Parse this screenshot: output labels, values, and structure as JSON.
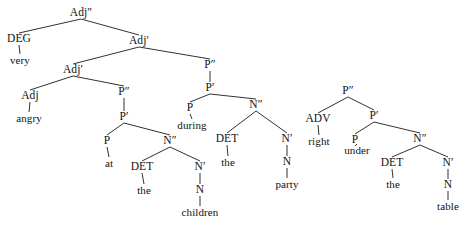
{
  "diagram": {
    "background_color": "#ffffff",
    "line_color": "#1a1a1a",
    "text_color": "#111111",
    "width": 465,
    "height": 225
  },
  "trees": [
    {
      "id": "tree-adjective-phrase",
      "root_label": "Adj″",
      "sentence": "very angry at the children during the party"
    },
    {
      "id": "tree-prepositional-phrase",
      "root_label": "P″",
      "sentence": "right under the table"
    }
  ],
  "nodes": [
    {
      "id": "n1",
      "label": "Adj″",
      "kind": "category",
      "x": 81,
      "y": 13,
      "tree": 0
    },
    {
      "id": "n2",
      "label": "DEG",
      "kind": "category",
      "x": 19,
      "y": 39,
      "tree": 0
    },
    {
      "id": "n3",
      "label": "very",
      "kind": "word",
      "x": 20,
      "y": 60,
      "tree": 0
    },
    {
      "id": "n4",
      "label": "Adj′",
      "kind": "category",
      "x": 139,
      "y": 41,
      "tree": 0
    },
    {
      "id": "n5",
      "label": "Adj′",
      "kind": "category",
      "x": 73,
      "y": 70,
      "tree": 0
    },
    {
      "id": "n6",
      "label": "Adj",
      "kind": "category",
      "x": 30,
      "y": 96,
      "tree": 0
    },
    {
      "id": "n7",
      "label": "angry",
      "kind": "word",
      "x": 29,
      "y": 118,
      "tree": 0
    },
    {
      "id": "n8",
      "label": "P″",
      "kind": "category",
      "x": 124,
      "y": 92,
      "tree": 0
    },
    {
      "id": "n9",
      "label": "P′",
      "kind": "category",
      "x": 124,
      "y": 117,
      "tree": 0
    },
    {
      "id": "n10",
      "label": "P",
      "kind": "category",
      "x": 107,
      "y": 141,
      "tree": 0
    },
    {
      "id": "n11",
      "label": "at",
      "kind": "word",
      "x": 109,
      "y": 163,
      "tree": 0
    },
    {
      "id": "n12",
      "label": "N″",
      "kind": "category",
      "x": 170,
      "y": 141,
      "tree": 0
    },
    {
      "id": "n13",
      "label": "DET",
      "kind": "category",
      "x": 142,
      "y": 167,
      "tree": 0
    },
    {
      "id": "n14",
      "label": "the",
      "kind": "word",
      "x": 144,
      "y": 190,
      "tree": 0
    },
    {
      "id": "n15",
      "label": "N′",
      "kind": "category",
      "x": 200,
      "y": 167,
      "tree": 0
    },
    {
      "id": "n16",
      "label": "N",
      "kind": "category",
      "x": 200,
      "y": 190,
      "tree": 0
    },
    {
      "id": "n17",
      "label": "children",
      "kind": "word",
      "x": 200,
      "y": 212,
      "tree": 0
    },
    {
      "id": "n18",
      "label": "P″",
      "kind": "category",
      "x": 210,
      "y": 65,
      "tree": 0
    },
    {
      "id": "n19",
      "label": "P′",
      "kind": "category",
      "x": 210,
      "y": 88,
      "tree": 0
    },
    {
      "id": "n20",
      "label": "P",
      "kind": "category",
      "x": 190,
      "y": 108,
      "tree": 0
    },
    {
      "id": "n21",
      "label": "during",
      "kind": "word",
      "x": 192,
      "y": 125,
      "tree": 0
    },
    {
      "id": "n22",
      "label": "N″",
      "kind": "category",
      "x": 256,
      "y": 105,
      "tree": 0
    },
    {
      "id": "n23",
      "label": "DET",
      "kind": "category",
      "x": 227,
      "y": 139,
      "tree": 0
    },
    {
      "id": "n24",
      "label": "the",
      "kind": "word",
      "x": 228,
      "y": 162,
      "tree": 0
    },
    {
      "id": "n25",
      "label": "N′",
      "kind": "category",
      "x": 287,
      "y": 139,
      "tree": 0
    },
    {
      "id": "n26",
      "label": "N",
      "kind": "category",
      "x": 287,
      "y": 162,
      "tree": 0
    },
    {
      "id": "n27",
      "label": "party",
      "kind": "word",
      "x": 287,
      "y": 184,
      "tree": 0
    },
    {
      "id": "n28",
      "label": "P″",
      "kind": "category",
      "x": 348,
      "y": 91,
      "tree": 1
    },
    {
      "id": "n29",
      "label": "ADV",
      "kind": "category",
      "x": 318,
      "y": 119,
      "tree": 1
    },
    {
      "id": "n30",
      "label": "right",
      "kind": "word",
      "x": 319,
      "y": 141,
      "tree": 1
    },
    {
      "id": "n31",
      "label": "P′",
      "kind": "category",
      "x": 374,
      "y": 116,
      "tree": 1
    },
    {
      "id": "n32",
      "label": "P",
      "kind": "category",
      "x": 355,
      "y": 140,
      "tree": 1
    },
    {
      "id": "n33",
      "label": "under",
      "kind": "word",
      "x": 357,
      "y": 150,
      "tree": 1
    },
    {
      "id": "n34",
      "label": "N″",
      "kind": "category",
      "x": 420,
      "y": 139,
      "tree": 1
    },
    {
      "id": "n35",
      "label": "DET",
      "kind": "category",
      "x": 392,
      "y": 163,
      "tree": 1
    },
    {
      "id": "n36",
      "label": "the",
      "kind": "word",
      "x": 393,
      "y": 184,
      "tree": 1
    },
    {
      "id": "n37",
      "label": "N′",
      "kind": "category",
      "x": 448,
      "y": 163,
      "tree": 1
    },
    {
      "id": "n38",
      "label": "N",
      "kind": "category",
      "x": 448,
      "y": 185,
      "tree": 1
    },
    {
      "id": "n39",
      "label": "table",
      "kind": "word",
      "x": 448,
      "y": 206,
      "tree": 1
    }
  ],
  "edges": [
    {
      "from": "n1",
      "to": "n2"
    },
    {
      "from": "n2",
      "to": "n3"
    },
    {
      "from": "n1",
      "to": "n4"
    },
    {
      "from": "n4",
      "to": "n5"
    },
    {
      "from": "n4",
      "to": "n18"
    },
    {
      "from": "n5",
      "to": "n6"
    },
    {
      "from": "n6",
      "to": "n7"
    },
    {
      "from": "n5",
      "to": "n8"
    },
    {
      "from": "n8",
      "to": "n9"
    },
    {
      "from": "n9",
      "to": "n10"
    },
    {
      "from": "n10",
      "to": "n11"
    },
    {
      "from": "n9",
      "to": "n12"
    },
    {
      "from": "n12",
      "to": "n13"
    },
    {
      "from": "n13",
      "to": "n14"
    },
    {
      "from": "n12",
      "to": "n15"
    },
    {
      "from": "n15",
      "to": "n16"
    },
    {
      "from": "n16",
      "to": "n17"
    },
    {
      "from": "n18",
      "to": "n19"
    },
    {
      "from": "n19",
      "to": "n20"
    },
    {
      "from": "n20",
      "to": "n21"
    },
    {
      "from": "n19",
      "to": "n22"
    },
    {
      "from": "n22",
      "to": "n23"
    },
    {
      "from": "n23",
      "to": "n24"
    },
    {
      "from": "n22",
      "to": "n25"
    },
    {
      "from": "n25",
      "to": "n26"
    },
    {
      "from": "n26",
      "to": "n27"
    },
    {
      "from": "n28",
      "to": "n29"
    },
    {
      "from": "n29",
      "to": "n30"
    },
    {
      "from": "n28",
      "to": "n31"
    },
    {
      "from": "n31",
      "to": "n32"
    },
    {
      "from": "n32",
      "to": "n33"
    },
    {
      "from": "n31",
      "to": "n34"
    },
    {
      "from": "n34",
      "to": "n35"
    },
    {
      "from": "n35",
      "to": "n36"
    },
    {
      "from": "n34",
      "to": "n37"
    },
    {
      "from": "n37",
      "to": "n38"
    },
    {
      "from": "n38",
      "to": "n39"
    }
  ]
}
